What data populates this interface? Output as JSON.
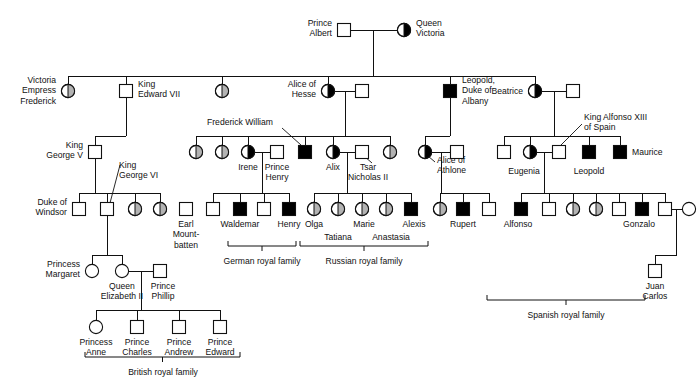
{
  "figure": {
    "symbol_legend": {
      "square": "male",
      "circle": "female",
      "open": "unaffected",
      "filled_black": "affected male",
      "half_black": "known carrier female",
      "half_gray": "possible carrier female"
    },
    "colors": {
      "line": "#111111",
      "affected": "#000000",
      "possible_carrier": "#b3b3b3",
      "unaffected": "#ffffff"
    }
  },
  "brackets": [
    {
      "id": "german",
      "label": "German royal family",
      "x1": 228,
      "x2": 296,
      "y": 246,
      "label_x": 262,
      "label_y": 264
    },
    {
      "id": "russian",
      "label": "Russian royal family",
      "x1": 300,
      "x2": 428,
      "y": 246,
      "label_x": 364,
      "label_y": 264
    },
    {
      "id": "british",
      "label": "British royal family",
      "x1": 85,
      "x2": 240,
      "y": 357,
      "label_x": 163,
      "label_y": 375
    },
    {
      "id": "spanish",
      "label": "Spanish royal family",
      "x1": 487,
      "x2": 645,
      "y": 300,
      "label_x": 566,
      "label_y": 318
    }
  ],
  "individuals": [
    {
      "id": "prince-albert",
      "label": "Prince\nAlbert",
      "shape": "square",
      "status": "open",
      "x": 344,
      "y": 30
    },
    {
      "id": "queen-victoria",
      "label": "Queen\nVictoria",
      "shape": "circle",
      "status": "half-black",
      "x": 404,
      "y": 30
    },
    {
      "id": "victoria-empress-frederick",
      "label": "Victoria\nEmpress\nFrederick",
      "shape": "circle",
      "status": "half-gray",
      "x": 68,
      "y": 91
    },
    {
      "id": "king-edward-vii",
      "label": "King\nEdward VII",
      "shape": "square",
      "status": "open",
      "x": 126,
      "y": 91
    },
    {
      "id": "gen2-daughter-a",
      "label": "",
      "shape": "circle",
      "status": "half-gray",
      "x": 222,
      "y": 91
    },
    {
      "id": "alice-of-hesse",
      "label": "Alice of\nHesse",
      "shape": "circle",
      "status": "half-black",
      "x": 328,
      "y": 91
    },
    {
      "id": "alice-of-hesse-spouse",
      "label": "",
      "shape": "square",
      "status": "open",
      "x": 362,
      "y": 91
    },
    {
      "id": "leopold-duke-of-albany",
      "label": "Leopold,\nDuke of\nAlbany",
      "shape": "square",
      "status": "black",
      "x": 450,
      "y": 91
    },
    {
      "id": "beatrice",
      "label": "Beatrice",
      "shape": "circle",
      "status": "half-black",
      "x": 535,
      "y": 91
    },
    {
      "id": "beatrice-spouse",
      "label": "",
      "shape": "square",
      "status": "open",
      "x": 573,
      "y": 91
    },
    {
      "id": "king-george-v",
      "label": "King\nGeorge V",
      "shape": "square",
      "status": "open",
      "x": 95,
      "y": 152
    },
    {
      "id": "hesse-d1",
      "label": "",
      "shape": "circle",
      "status": "half-gray",
      "x": 196,
      "y": 152
    },
    {
      "id": "hesse-d2",
      "label": "",
      "shape": "circle",
      "status": "half-gray",
      "x": 222,
      "y": 152
    },
    {
      "id": "irene",
      "label": "Irene",
      "shape": "circle",
      "status": "half-black",
      "x": 248,
      "y": 152
    },
    {
      "id": "prince-henry",
      "label": "Prince\nHenry",
      "shape": "square",
      "status": "open",
      "x": 277,
      "y": 152
    },
    {
      "id": "frederick-william",
      "label": "Frederick William",
      "shape": "square",
      "status": "black",
      "x": 305,
      "y": 152
    },
    {
      "id": "alix",
      "label": "Alix",
      "shape": "circle",
      "status": "half-black",
      "x": 333,
      "y": 152
    },
    {
      "id": "tsar-nicholas-ii",
      "label": "Tsar\nNicholas II",
      "shape": "square",
      "status": "open",
      "x": 362,
      "y": 152
    },
    {
      "id": "hesse-d3",
      "label": "",
      "shape": "circle",
      "status": "half-gray",
      "x": 390,
      "y": 152
    },
    {
      "id": "alice-of-athlone",
      "label": "Alice of\nAthlone",
      "shape": "circle",
      "status": "half-black",
      "x": 425,
      "y": 152
    },
    {
      "id": "alice-of-athlone-spouse",
      "label": "",
      "shape": "square",
      "status": "open",
      "x": 457,
      "y": 152
    },
    {
      "id": "beatrice-son-1",
      "label": "",
      "shape": "square",
      "status": "open",
      "x": 504,
      "y": 152
    },
    {
      "id": "eugenia",
      "label": "Eugenia",
      "shape": "circle",
      "status": "half-black",
      "x": 530,
      "y": 152
    },
    {
      "id": "king-alfonso-xiii",
      "label": "King Alfonso XIII\nof Spain",
      "shape": "square",
      "status": "open",
      "x": 559,
      "y": 152
    },
    {
      "id": "leopold-battenberg",
      "label": "Leopold",
      "shape": "square",
      "status": "black",
      "x": 589,
      "y": 152
    },
    {
      "id": "maurice",
      "label": "Maurice",
      "shape": "square",
      "status": "black",
      "x": 620,
      "y": 152
    },
    {
      "id": "duke-of-windsor",
      "label": "Duke of\nWindsor",
      "shape": "square",
      "status": "open",
      "x": 79,
      "y": 209
    },
    {
      "id": "king-george-vi",
      "label": "King\nGeorge VI",
      "shape": "square",
      "status": "open",
      "x": 107,
      "y": 209
    },
    {
      "id": "gv-d1",
      "label": "",
      "shape": "circle",
      "status": "half-gray",
      "x": 135,
      "y": 209
    },
    {
      "id": "gv-d2",
      "label": "",
      "shape": "circle",
      "status": "half-gray",
      "x": 160,
      "y": 209
    },
    {
      "id": "earl-mountbatten",
      "label": "Earl\nMount-\nbatten",
      "shape": "square",
      "status": "open",
      "x": 186,
      "y": 209
    },
    {
      "id": "german-s1",
      "label": "",
      "shape": "square",
      "status": "open",
      "x": 213,
      "y": 209
    },
    {
      "id": "waldemar",
      "label": "Waldemar",
      "shape": "square",
      "status": "black",
      "x": 240,
      "y": 209
    },
    {
      "id": "german-s3",
      "label": "",
      "shape": "square",
      "status": "open",
      "x": 264,
      "y": 209
    },
    {
      "id": "henry",
      "label": "Henry",
      "shape": "square",
      "status": "black",
      "x": 289,
      "y": 209
    },
    {
      "id": "olga",
      "label": "Olga",
      "shape": "circle",
      "status": "half-gray",
      "x": 314,
      "y": 209
    },
    {
      "id": "tatiana",
      "label": "Tatiana",
      "shape": "circle",
      "status": "half-gray",
      "x": 338,
      "y": 209
    },
    {
      "id": "marie",
      "label": "Marie",
      "shape": "circle",
      "status": "half-gray",
      "x": 362,
      "y": 209
    },
    {
      "id": "anastasia",
      "label": "Anastasia",
      "shape": "circle",
      "status": "half-gray",
      "x": 386,
      "y": 209
    },
    {
      "id": "alexis",
      "label": "Alexis",
      "shape": "square",
      "status": "black",
      "x": 411,
      "y": 209
    },
    {
      "id": "athlone-d",
      "label": "",
      "shape": "circle",
      "status": "half-gray",
      "x": 440,
      "y": 209
    },
    {
      "id": "rupert",
      "label": "Rupert",
      "shape": "square",
      "status": "black",
      "x": 463,
      "y": 209
    },
    {
      "id": "athlone-s",
      "label": "",
      "shape": "square",
      "status": "open",
      "x": 489,
      "y": 209
    },
    {
      "id": "alfonso",
      "label": "Alfonso",
      "shape": "square",
      "status": "black",
      "x": 521,
      "y": 209
    },
    {
      "id": "spain-s2",
      "label": "",
      "shape": "square",
      "status": "open",
      "x": 549,
      "y": 209
    },
    {
      "id": "spain-d1",
      "label": "",
      "shape": "circle",
      "status": "half-gray",
      "x": 573,
      "y": 209
    },
    {
      "id": "spain-d2",
      "label": "",
      "shape": "circle",
      "status": "half-gray",
      "x": 596,
      "y": 209
    },
    {
      "id": "spain-s3",
      "label": "",
      "shape": "square",
      "status": "open",
      "x": 619,
      "y": 209
    },
    {
      "id": "gonzalo",
      "label": "Gonzalo",
      "shape": "square",
      "status": "black",
      "x": 642,
      "y": 209
    },
    {
      "id": "juan-father",
      "label": "",
      "shape": "square",
      "status": "open",
      "x": 665,
      "y": 209
    },
    {
      "id": "juan-mother",
      "label": "",
      "shape": "circle",
      "status": "open",
      "x": 689,
      "y": 209
    },
    {
      "id": "princess-margaret",
      "label": "Princess\nMargaret",
      "shape": "circle",
      "status": "open",
      "x": 92,
      "y": 271
    },
    {
      "id": "queen-elizabeth-ii",
      "label": "Queen\nElizabeth II",
      "shape": "circle",
      "status": "open",
      "x": 122,
      "y": 271
    },
    {
      "id": "prince-phillip",
      "label": "Prince\nPhillip",
      "shape": "square",
      "status": "open",
      "x": 160,
      "y": 271
    },
    {
      "id": "juan-carlos",
      "label": "Juan\nCarlos",
      "shape": "square",
      "status": "open",
      "x": 655,
      "y": 271
    },
    {
      "id": "princess-anne",
      "label": "Princess\nAnne",
      "shape": "circle",
      "status": "open",
      "x": 96,
      "y": 327
    },
    {
      "id": "prince-charles",
      "label": "Prince\nCharles",
      "shape": "square",
      "status": "open",
      "x": 137,
      "y": 327
    },
    {
      "id": "prince-andrew",
      "label": "Prince\nAndrew",
      "shape": "square",
      "status": "open",
      "x": 179,
      "y": 327
    },
    {
      "id": "prince-edward",
      "label": "Prince\nEdward",
      "shape": "square",
      "status": "open",
      "x": 220,
      "y": 327
    }
  ],
  "labels": [
    {
      "id": "lbl-prince-albert",
      "text": [
        "Prince",
        "Albert"
      ],
      "x": 332,
      "y": 26,
      "anchor": "end"
    },
    {
      "id": "lbl-queen-victoria",
      "text": [
        "Queen",
        "Victoria"
      ],
      "x": 416,
      "y": 26,
      "anchor": "start"
    },
    {
      "id": "lbl-victoria-empress-frederick",
      "text": [
        "Victoria",
        "Empress",
        "Frederick"
      ],
      "x": 56,
      "y": 83,
      "anchor": "end"
    },
    {
      "id": "lbl-king-edward-vii",
      "text": [
        "King",
        "Edward VII"
      ],
      "x": 138,
      "y": 87,
      "anchor": "start"
    },
    {
      "id": "lbl-alice-of-hesse",
      "text": [
        "Alice of",
        "Hesse"
      ],
      "x": 316,
      "y": 87,
      "anchor": "end"
    },
    {
      "id": "lbl-leopold-albany",
      "text": [
        "Leopold,",
        "Duke of",
        "Albany"
      ],
      "x": 462,
      "y": 83,
      "anchor": "start"
    },
    {
      "id": "lbl-beatrice",
      "text": [
        "Beatrice"
      ],
      "x": 523,
      "y": 94,
      "anchor": "end"
    },
    {
      "id": "lbl-king-george-v",
      "text": [
        "King",
        "George V"
      ],
      "x": 83,
      "y": 148,
      "anchor": "end"
    },
    {
      "id": "lbl-king-george-vi",
      "text": [
        "King",
        "George VI"
      ],
      "x": 119,
      "y": 168,
      "anchor": "start"
    },
    {
      "id": "lbl-frederick-william",
      "text": [
        "Frederick William"
      ],
      "x": 207,
      "y": 125,
      "anchor": "start"
    },
    {
      "id": "lbl-irene",
      "text": [
        "Irene"
      ],
      "x": 248,
      "y": 170,
      "anchor": "middle"
    },
    {
      "id": "lbl-prince-henry",
      "text": [
        "Prince",
        "Henry"
      ],
      "x": 277,
      "y": 170,
      "anchor": "middle"
    },
    {
      "id": "lbl-alix",
      "text": [
        "Alix"
      ],
      "x": 333,
      "y": 170,
      "anchor": "middle"
    },
    {
      "id": "lbl-tsar-nicholas",
      "text": [
        "Tsar",
        "Nicholas II"
      ],
      "x": 368,
      "y": 170,
      "anchor": "middle"
    },
    {
      "id": "lbl-alice-of-athlone",
      "text": [
        "Alice of",
        "Athlone"
      ],
      "x": 437,
      "y": 163,
      "anchor": "start"
    },
    {
      "id": "lbl-king-alfonso",
      "text": [
        "King Alfonso XIII",
        "of Spain"
      ],
      "x": 584,
      "y": 120,
      "anchor": "start"
    },
    {
      "id": "lbl-eugenia",
      "text": [
        "Eugenia"
      ],
      "x": 524,
      "y": 174,
      "anchor": "middle"
    },
    {
      "id": "lbl-leopold-batt",
      "text": [
        "Leopold"
      ],
      "x": 589,
      "y": 174,
      "anchor": "middle"
    },
    {
      "id": "lbl-maurice",
      "text": [
        "Maurice"
      ],
      "x": 632,
      "y": 155,
      "anchor": "start"
    },
    {
      "id": "lbl-duke-of-windsor",
      "text": [
        "Duke of",
        "Windsor"
      ],
      "x": 67,
      "y": 205,
      "anchor": "end"
    },
    {
      "id": "lbl-earl-mountbatten",
      "text": [
        "Earl",
        "Mount-",
        "batten"
      ],
      "x": 186,
      "y": 227,
      "anchor": "middle"
    },
    {
      "id": "lbl-waldemar",
      "text": [
        "Waldemar"
      ],
      "x": 240,
      "y": 227,
      "anchor": "middle"
    },
    {
      "id": "lbl-henry",
      "text": [
        "Henry"
      ],
      "x": 289,
      "y": 227,
      "anchor": "middle"
    },
    {
      "id": "lbl-olga",
      "text": [
        "Olga"
      ],
      "x": 314,
      "y": 227,
      "anchor": "middle"
    },
    {
      "id": "lbl-tatiana",
      "text": [
        "Tatiana"
      ],
      "x": 338,
      "y": 240,
      "anchor": "middle"
    },
    {
      "id": "lbl-marie",
      "text": [
        "Marie"
      ],
      "x": 364,
      "y": 227,
      "anchor": "middle"
    },
    {
      "id": "lbl-anastasia",
      "text": [
        "Anastasia"
      ],
      "x": 391,
      "y": 240,
      "anchor": "middle"
    },
    {
      "id": "lbl-alexis",
      "text": [
        "Alexis"
      ],
      "x": 414,
      "y": 227,
      "anchor": "middle"
    },
    {
      "id": "lbl-rupert",
      "text": [
        "Rupert"
      ],
      "x": 463,
      "y": 227,
      "anchor": "middle"
    },
    {
      "id": "lbl-alfonso",
      "text": [
        "Alfonso"
      ],
      "x": 518,
      "y": 227,
      "anchor": "middle"
    },
    {
      "id": "lbl-gonzalo",
      "text": [
        "Gonzalo"
      ],
      "x": 639,
      "y": 227,
      "anchor": "middle"
    },
    {
      "id": "lbl-princess-margaret",
      "text": [
        "Princess",
        "Margaret"
      ],
      "x": 80,
      "y": 267,
      "anchor": "end"
    },
    {
      "id": "lbl-queen-elizabeth",
      "text": [
        "Queen",
        "Elizabeth II"
      ],
      "x": 122,
      "y": 289,
      "anchor": "middle"
    },
    {
      "id": "lbl-prince-phillip",
      "text": [
        "Prince",
        "Phillip"
      ],
      "x": 163,
      "y": 289,
      "anchor": "middle"
    },
    {
      "id": "lbl-juan-carlos",
      "text": [
        "Juan",
        "Carlos"
      ],
      "x": 655,
      "y": 289,
      "anchor": "middle"
    },
    {
      "id": "lbl-princess-anne",
      "text": [
        "Princess",
        "Anne"
      ],
      "x": 96,
      "y": 345,
      "anchor": "middle"
    },
    {
      "id": "lbl-prince-charles",
      "text": [
        "Prince",
        "Charles"
      ],
      "x": 137,
      "y": 345,
      "anchor": "middle"
    },
    {
      "id": "lbl-prince-andrew",
      "text": [
        "Prince",
        "Andrew"
      ],
      "x": 179,
      "y": 345,
      "anchor": "middle"
    },
    {
      "id": "lbl-prince-edward",
      "text": [
        "Prince",
        "Edward"
      ],
      "x": 220,
      "y": 345,
      "anchor": "middle"
    }
  ],
  "pointers": [
    {
      "id": "ptr-frederick-william",
      "x1": 282,
      "y1": 128,
      "x2": 301,
      "y2": 145
    },
    {
      "id": "ptr-tsar-nicholas",
      "x1": 372,
      "y1": 163,
      "x2": 364,
      "y2": 156
    },
    {
      "id": "ptr-king-alfonso",
      "x1": 582,
      "y1": 124,
      "x2": 560,
      "y2": 146
    },
    {
      "id": "ptr-king-george-vi",
      "x1": 120,
      "y1": 165,
      "x2": 110,
      "y2": 203
    },
    {
      "id": "ptr-alice-of-athlone",
      "x1": 435,
      "y1": 162,
      "x2": 428,
      "y2": 156
    }
  ],
  "connectors": {
    "description": "mating lines, sibship lines and descent lines of the pedigree"
  }
}
